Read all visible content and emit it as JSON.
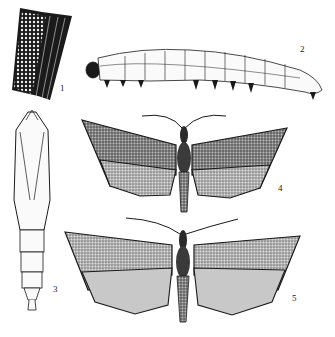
{
  "figure": {
    "type": "scientific-illustration",
    "panels": [
      {
        "id": 1,
        "label": "1",
        "depicts": "egg mass on leaf/stem"
      },
      {
        "id": 2,
        "label": "2",
        "depicts": "larva (caterpillar), lateral view"
      },
      {
        "id": 3,
        "label": "3",
        "depicts": "pupa, ventral view"
      },
      {
        "id": 4,
        "label": "4",
        "depicts": "adult moth, wings spread (darker specimen)"
      },
      {
        "id": 5,
        "label": "5",
        "depicts": "adult moth, wings spread (lighter specimen)"
      }
    ]
  },
  "colors": {
    "ink": "#1a1a1a",
    "paper": "#ffffff",
    "stipple": "#555555"
  }
}
